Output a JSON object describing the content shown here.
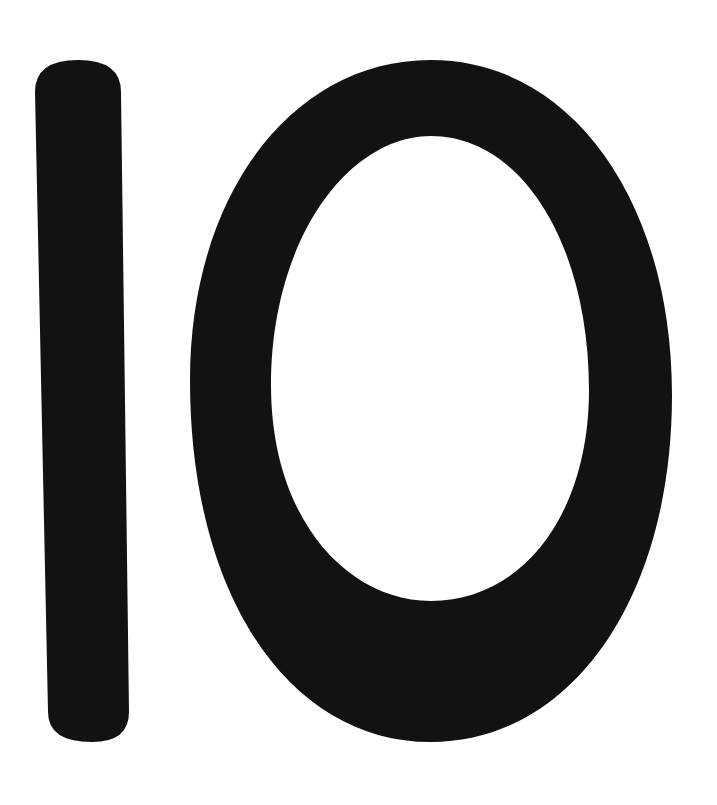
{
  "image": {
    "text": "10",
    "digits": [
      "1",
      "0"
    ],
    "colors": {
      "glyph": "#121212",
      "background": "#ffffff"
    }
  }
}
